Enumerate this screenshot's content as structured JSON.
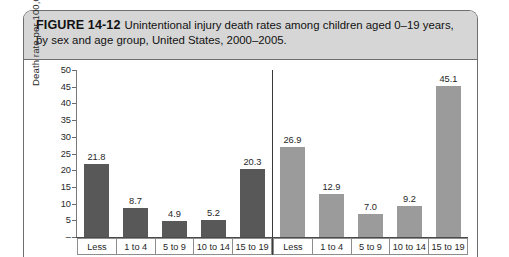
{
  "figure": {
    "number_label": "FIGURE 14-12",
    "caption": "Unintentional injury death rates among children aged 0–19 years, by sex and age group, United States, 2000–2005."
  },
  "colors": {
    "caption_background": "#d6d6d6",
    "frame_border": "#6e6e6e",
    "series_1_bar": "#585858",
    "series_2_bar": "#9b9b9b",
    "axis": "#7a7a7a"
  },
  "chart_data": {
    "type": "bar",
    "title": "Unintentional injury death rates among children aged 0–19 years, by sex and age group, United States, 2000–2005.",
    "xlabel": "",
    "ylabel": "Death rate per 100,000 population",
    "ylim": [
      0,
      50
    ],
    "ytick_labels": [
      "50",
      "45",
      "40",
      "35",
      "30",
      "25",
      "20",
      "15",
      "10",
      "5",
      "–"
    ],
    "ytick_values": [
      50,
      45,
      40,
      35,
      30,
      25,
      20,
      15,
      10,
      5,
      0
    ],
    "grid": false,
    "legend_position": "none",
    "categories": [
      "Less",
      "1 to 4",
      "5 to 9",
      "10 to 14",
      "15 to 19"
    ],
    "panels": [
      {
        "name": "group-1",
        "categories": [
          "Less",
          "1 to 4",
          "5 to 9",
          "10 to 14",
          "15 to 19"
        ],
        "values": [
          21.8,
          8.7,
          4.9,
          5.2,
          20.3
        ],
        "value_labels": [
          "21.8",
          "8.7",
          "4.9",
          "5.2",
          "20.3"
        ],
        "bar_color": "#585858"
      },
      {
        "name": "group-2",
        "categories": [
          "Less",
          "1 to 4",
          "5 to 9",
          "10 to 14",
          "15 to 19"
        ],
        "values": [
          26.9,
          12.9,
          7.0,
          9.2,
          45.1
        ],
        "value_labels": [
          "26.9",
          "12.9",
          "7.0",
          "9.2",
          "45.1"
        ],
        "bar_color": "#9b9b9b"
      }
    ]
  }
}
